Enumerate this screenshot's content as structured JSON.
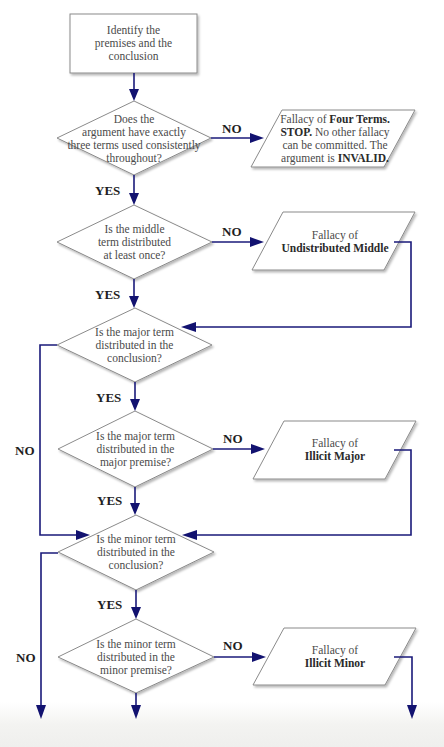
{
  "flowchart": {
    "start": {
      "lines": [
        "Identify the",
        "premises and the",
        "conclusion"
      ]
    },
    "decisions": [
      {
        "id": "three-terms",
        "lines": [
          "Does the",
          "argument have exactly",
          "three terms used consistently",
          "throughout?"
        ]
      },
      {
        "id": "middle-distributed",
        "lines": [
          "Is the middle",
          "term distributed",
          "at least once?"
        ]
      },
      {
        "id": "major-in-conclusion",
        "lines": [
          "Is the major term",
          "distributed in the",
          "conclusion?"
        ]
      },
      {
        "id": "major-in-premise",
        "lines": [
          "Is the major term",
          "distributed in the",
          "major premise?"
        ]
      },
      {
        "id": "minor-in-conclusion",
        "lines": [
          "Is the minor term",
          "distributed in the",
          "conclusion?"
        ]
      },
      {
        "id": "minor-in-premise",
        "lines": [
          "Is the minor term",
          "distributed in the",
          "minor premise?"
        ]
      }
    ],
    "fallacies": [
      {
        "id": "four-terms",
        "line1_plain": "Fallacy of ",
        "line1_bold": "Four Terms.",
        "line2_bold": "STOP.",
        "line2_plain": " No other fallacy",
        "line3_plain": "can be committed. The",
        "line4_plain": "argument is ",
        "line4_bold": "INVALID."
      },
      {
        "id": "undistributed-middle",
        "line1_plain": "Fallacy of",
        "line2_bold": "Undistributed Middle"
      },
      {
        "id": "illicit-major",
        "line1_plain": "Fallacy of",
        "line2_bold": "Illicit Major"
      },
      {
        "id": "illicit-minor",
        "line1_plain": "Fallacy of",
        "line2_bold": "Illicit Minor"
      }
    ],
    "labels": {
      "yes": "YES",
      "no": "NO"
    },
    "colors": {
      "connector": "#1a1a7a",
      "arrowhead": "#121270",
      "shape_border": "#8a8a8a",
      "text": "#4a4a4a"
    }
  }
}
